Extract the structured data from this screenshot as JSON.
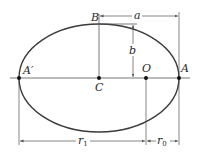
{
  "diagram": {
    "type": "ellipse-orbit-geometry",
    "colors": {
      "stroke": "#3a3a3a",
      "line": "#555555",
      "text": "#2a2a2a",
      "background": "#ffffff"
    },
    "points": {
      "A": "A",
      "A_prime": "A′",
      "B": "B",
      "C": "C",
      "O": "O"
    },
    "dimensions": {
      "semi_major": "a",
      "semi_minor": "b",
      "r1": "r",
      "r1_sub": "1",
      "r0": "r",
      "r0_sub": "0"
    }
  }
}
